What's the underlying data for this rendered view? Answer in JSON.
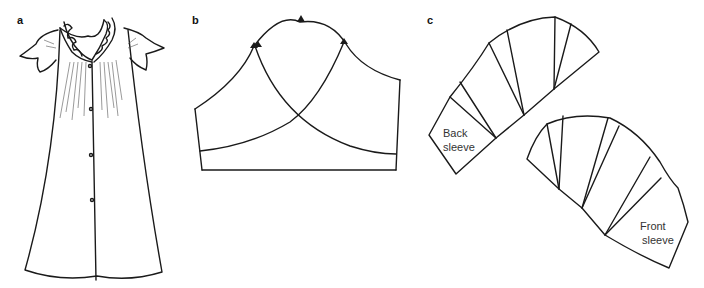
{
  "figure": {
    "panels": [
      {
        "id": "a",
        "label": "a",
        "description": "Nightgown with ruffled collar, flutter sleeves and front button placket"
      },
      {
        "id": "b",
        "label": "b",
        "description": "Sleeve pattern with overlapping back and front cap curves and notches"
      },
      {
        "id": "c",
        "label": "c",
        "description": "Sleeve pieces slashed and spread"
      }
    ],
    "pieces": {
      "back": {
        "line1": "Back",
        "line2": "sleeve"
      },
      "front": {
        "line1": "Front",
        "line2": "sleeve"
      }
    },
    "colors": {
      "line": "#1a1a1a",
      "background": "#ffffff",
      "text": "#333333"
    }
  }
}
